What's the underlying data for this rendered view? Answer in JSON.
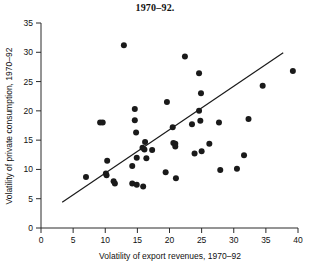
{
  "chart_data": {
    "type": "scatter",
    "title": "1970–92.",
    "xlabel": "Volatility of export revenues, 1970–92",
    "ylabel": "Volatility of private consumption, 1970–92",
    "xlim": [
      0,
      40
    ],
    "ylim": [
      0,
      35
    ],
    "xticks": [
      0,
      5,
      10,
      15,
      20,
      25,
      30,
      35,
      40
    ],
    "yticks": [
      0,
      5,
      10,
      15,
      20,
      25,
      30,
      35
    ],
    "xtick_labels": [
      "0",
      "5",
      "10",
      "15",
      "20",
      "25",
      "30",
      "35",
      "40"
    ],
    "ytick_labels": [
      "0",
      "5",
      "10",
      "15",
      "20",
      "25",
      "30",
      "35"
    ],
    "grid": false,
    "legend": "none",
    "marker_color": "#1a1a1a",
    "marker_size": 3,
    "line_color": "#1a1a1a",
    "points": [
      {
        "x": 12.9,
        "y": 31.2
      },
      {
        "x": 22.4,
        "y": 29.3
      },
      {
        "x": 24.6,
        "y": 26.4
      },
      {
        "x": 39.2,
        "y": 26.8
      },
      {
        "x": 34.5,
        "y": 24.3
      },
      {
        "x": 24.9,
        "y": 23.0
      },
      {
        "x": 19.6,
        "y": 21.5
      },
      {
        "x": 14.6,
        "y": 20.3
      },
      {
        "x": 24.6,
        "y": 20.0
      },
      {
        "x": 24.8,
        "y": 18.3
      },
      {
        "x": 27.7,
        "y": 18.0
      },
      {
        "x": 32.3,
        "y": 18.6
      },
      {
        "x": 9.2,
        "y": 18.0
      },
      {
        "x": 9.6,
        "y": 18.0
      },
      {
        "x": 14.6,
        "y": 18.4
      },
      {
        "x": 23.5,
        "y": 17.7
      },
      {
        "x": 20.5,
        "y": 17.2
      },
      {
        "x": 14.8,
        "y": 16.3
      },
      {
        "x": 16.2,
        "y": 14.7
      },
      {
        "x": 20.6,
        "y": 14.5
      },
      {
        "x": 20.9,
        "y": 14.4
      },
      {
        "x": 20.9,
        "y": 13.9
      },
      {
        "x": 26.2,
        "y": 14.4
      },
      {
        "x": 15.8,
        "y": 13.7
      },
      {
        "x": 16.1,
        "y": 13.4
      },
      {
        "x": 17.3,
        "y": 13.3
      },
      {
        "x": 25.0,
        "y": 13.1
      },
      {
        "x": 23.9,
        "y": 12.7
      },
      {
        "x": 31.6,
        "y": 12.4
      },
      {
        "x": 14.9,
        "y": 12.0
      },
      {
        "x": 16.4,
        "y": 11.9
      },
      {
        "x": 10.3,
        "y": 11.5
      },
      {
        "x": 14.2,
        "y": 10.6
      },
      {
        "x": 27.9,
        "y": 9.9
      },
      {
        "x": 30.5,
        "y": 10.1
      },
      {
        "x": 19.4,
        "y": 9.5
      },
      {
        "x": 10.1,
        "y": 9.3
      },
      {
        "x": 10.2,
        "y": 9.0
      },
      {
        "x": 11.3,
        "y": 8.0
      },
      {
        "x": 11.5,
        "y": 7.6
      },
      {
        "x": 7.0,
        "y": 8.7
      },
      {
        "x": 21.0,
        "y": 8.5
      },
      {
        "x": 14.2,
        "y": 7.6
      },
      {
        "x": 14.9,
        "y": 7.4
      },
      {
        "x": 15.9,
        "y": 7.1
      }
    ],
    "fit_line": {
      "x0": 3.3,
      "y0": 4.4,
      "x1": 37.7,
      "y1": 29.9
    }
  }
}
